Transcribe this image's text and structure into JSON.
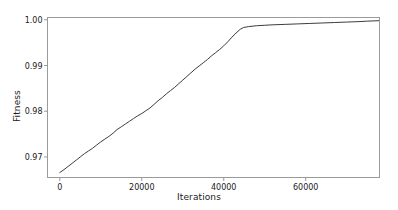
{
  "chart_data": {
    "type": "line",
    "title": "",
    "subtitle": "",
    "xlabel": "Iterations",
    "ylabel": "Fitness",
    "xlim": [
      -3000,
      78000
    ],
    "ylim": [
      0.9655,
      1.0005
    ],
    "grid": false,
    "legend": null,
    "legend_position": "none",
    "line_color": "#3c3c3c",
    "line_width": 1,
    "frame_color": "#9a9a9a",
    "background_color": "#ffffff",
    "xticks": [
      0,
      20000,
      40000,
      60000
    ],
    "xtick_labels": [
      "0",
      "20000",
      "40000",
      "60000"
    ],
    "yticks": [
      0.97,
      0.98,
      0.99,
      1.0
    ],
    "ytick_labels": [
      "0.97",
      "0.98",
      "0.99",
      "1.00"
    ],
    "series": [
      {
        "name": "Fitness",
        "x": [
          0,
          1000,
          2000,
          3000,
          4000,
          5000,
          6000,
          7000,
          8000,
          9000,
          10000,
          11000,
          12000,
          13000,
          14000,
          15000,
          16000,
          17000,
          18000,
          19000,
          20000,
          21000,
          22000,
          23000,
          24000,
          25000,
          26000,
          27000,
          28000,
          29000,
          30000,
          31000,
          32000,
          33000,
          34000,
          35000,
          36000,
          37000,
          38000,
          39000,
          40000,
          41000,
          42000,
          43000,
          44000,
          44800,
          46000,
          48000,
          50000,
          52000,
          55000,
          58000,
          61000,
          64000,
          67000,
          70000,
          73000,
          75000,
          77800
        ],
        "y": [
          0.9666,
          0.9672,
          0.9679,
          0.9686,
          0.9693,
          0.97,
          0.9707,
          0.9713,
          0.9719,
          0.9726,
          0.9733,
          0.9739,
          0.9745,
          0.9752,
          0.976,
          0.9766,
          0.9772,
          0.9778,
          0.9784,
          0.979,
          0.9795,
          0.9801,
          0.9807,
          0.9815,
          0.9823,
          0.983,
          0.9838,
          0.9845,
          0.9852,
          0.986,
          0.9868,
          0.9876,
          0.9884,
          0.9892,
          0.9899,
          0.9906,
          0.9913,
          0.9921,
          0.9928,
          0.9935,
          0.9943,
          0.9952,
          0.9962,
          0.9971,
          0.9979,
          0.9983,
          0.9985,
          0.9987,
          0.9988,
          0.9989,
          0.999,
          0.9991,
          0.9992,
          0.9993,
          0.9994,
          0.9995,
          0.9996,
          0.9997,
          0.9998
        ]
      }
    ]
  }
}
